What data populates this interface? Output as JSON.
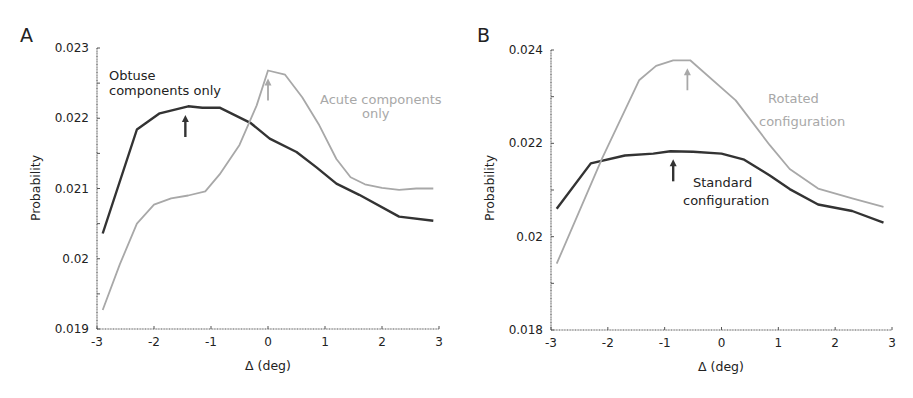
{
  "chart_data": [
    {
      "type": "line",
      "panel": "A",
      "title": "",
      "xlabel": "Δ (deg)",
      "ylabel": "Probability",
      "xlim": [
        -3,
        3
      ],
      "ylim": [
        0.019,
        0.023
      ],
      "xticks": [
        "-3",
        "-2",
        "-1",
        "0",
        "1",
        "2",
        "3"
      ],
      "yticks": [
        "0.019",
        "0.02",
        "0.021",
        "0.022",
        "0.023"
      ],
      "grid": false,
      "legend": "inline annotations",
      "series": [
        {
          "name": "Obtuse components only",
          "color": "#333333",
          "x": [
            -2.9,
            -2.3,
            -1.9,
            -1.4,
            -1.15,
            -0.85,
            -0.3,
            0.03,
            0.5,
            0.85,
            1.2,
            1.6,
            2.3,
            2.9
          ],
          "values": [
            0.02036,
            0.02184,
            0.02207,
            0.02217,
            0.02215,
            0.02215,
            0.02193,
            0.02171,
            0.02152,
            0.0213,
            0.02107,
            0.02091,
            0.0206,
            0.02054
          ],
          "peak_arrow_x": -1.45
        },
        {
          "name": "Acute components only",
          "color": "#a8a8a8",
          "x": [
            -2.9,
            -2.6,
            -2.3,
            -2.0,
            -1.7,
            -1.4,
            -1.1,
            -0.85,
            -0.5,
            -0.2,
            0.0,
            0.3,
            0.6,
            0.9,
            1.2,
            1.45,
            1.7,
            2.0,
            2.3,
            2.6,
            2.9
          ],
          "values": [
            0.01927,
            0.01992,
            0.0205,
            0.02077,
            0.02086,
            0.0209,
            0.02096,
            0.0212,
            0.02162,
            0.02218,
            0.02268,
            0.02262,
            0.0223,
            0.0219,
            0.02142,
            0.02116,
            0.02106,
            0.02101,
            0.02098,
            0.021,
            0.021
          ],
          "peak_arrow_x": 0.0
        }
      ],
      "annotations": [
        {
          "text": "Obtuse",
          "series": "Obtuse components only"
        },
        {
          "text": "components only",
          "series": "Obtuse components only"
        },
        {
          "text": "Acute components",
          "series": "Acute components only"
        },
        {
          "text": "only",
          "series": "Acute components only"
        }
      ]
    },
    {
      "type": "line",
      "panel": "B",
      "title": "",
      "xlabel": "Δ (deg)",
      "ylabel": "Probability",
      "xlim": [
        -3,
        3
      ],
      "ylim": [
        0.018,
        0.024
      ],
      "xticks": [
        "-3",
        "-2",
        "-1",
        "0",
        "1",
        "2",
        "3"
      ],
      "yticks": [
        "0.018",
        "0.02",
        "0.022",
        "0.024"
      ],
      "grid": false,
      "legend": "inline annotations",
      "series": [
        {
          "name": "Standard configuration",
          "color": "#333333",
          "x": [
            -2.9,
            -2.3,
            -1.7,
            -1.2,
            -0.9,
            -0.5,
            0.0,
            0.4,
            0.85,
            1.2,
            1.7,
            2.3,
            2.85
          ],
          "values": [
            0.0206,
            0.02157,
            0.02174,
            0.02178,
            0.02183,
            0.02182,
            0.02178,
            0.02165,
            0.02131,
            0.02102,
            0.02069,
            0.02055,
            0.0203
          ],
          "peak_arrow_x": -0.85
        },
        {
          "name": "Rotated configuration",
          "color": "#a8a8a8",
          "x": [
            -2.9,
            -2.1,
            -1.45,
            -1.15,
            -0.85,
            -0.55,
            0.25,
            0.85,
            1.2,
            1.7,
            2.3,
            2.85
          ],
          "values": [
            0.01942,
            0.02168,
            0.02335,
            0.02366,
            0.02378,
            0.02378,
            0.02292,
            0.02196,
            0.02145,
            0.02103,
            0.02082,
            0.02064
          ],
          "peak_arrow_x": -0.6
        }
      ],
      "annotations": [
        {
          "text": "Standard",
          "series": "Standard configuration"
        },
        {
          "text": "configuration",
          "series": "Standard configuration"
        },
        {
          "text": "Rotated",
          "series": "Rotated configuration"
        },
        {
          "text": "configuration",
          "series": "Rotated configuration"
        }
      ]
    }
  ],
  "figure": {
    "panels": [
      {
        "letter": "A",
        "ylabel": "Probability",
        "xlabel": "Δ (deg)",
        "annot_dark": [
          "Obtuse",
          "components only"
        ],
        "annot_light": [
          "Acute components",
          "only"
        ]
      },
      {
        "letter": "B",
        "ylabel": "Probability",
        "xlabel": "Δ (deg)",
        "annot_dark": [
          "Standard",
          "configuration"
        ],
        "annot_light": [
          "Rotated",
          "configuration"
        ]
      }
    ]
  }
}
